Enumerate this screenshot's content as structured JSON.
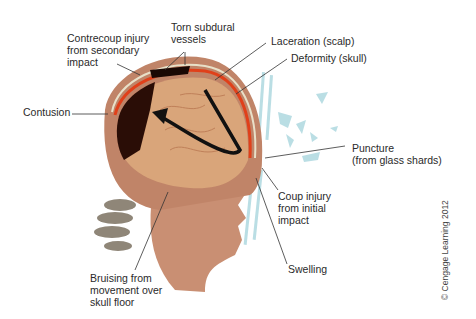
{
  "figure": {
    "labels": {
      "contrecoup": "Contrecoup injury\nfrom secondary\nimpact",
      "torn_vessels": "Torn subdural\nvessels",
      "laceration": "Laceration (scalp)",
      "deformity": "Deformity (skull)",
      "contusion": "Contusion",
      "puncture": "Puncture\n(from glass shards)",
      "coup": "Coup injury\nfrom initial\nimpact",
      "swelling": "Swelling",
      "bruising": "Bruising from\nmovement over\nskull floor"
    },
    "copyright": "© Cengage Learning 2012",
    "colors": {
      "skin": "#c98f73",
      "brain": "#d9a57a",
      "blood": "#e0401a",
      "dark_hematoma": "#2a0d06",
      "glass": "#a9d6de",
      "leader_line": "#333333",
      "arrow": "#111111"
    }
  }
}
